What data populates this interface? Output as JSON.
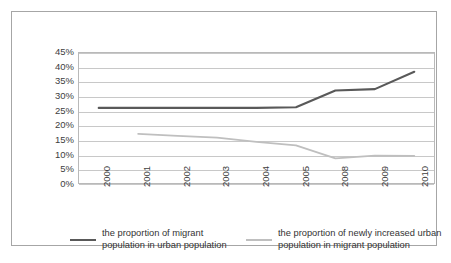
{
  "chart_data": {
    "type": "line",
    "title": "",
    "subtitle": "",
    "xlabel": "",
    "ylabel": "",
    "categories": [
      "2000",
      "2001",
      "2002",
      "2003",
      "2004",
      "2005",
      "2008",
      "2009",
      "2010"
    ],
    "ylim": [
      0,
      45
    ],
    "y_tick_labels": [
      "0%",
      "5%",
      "10%",
      "15%",
      "20%",
      "25%",
      "30%",
      "35%",
      "40%",
      "45%"
    ],
    "y_tick_values": [
      0,
      5,
      10,
      15,
      20,
      25,
      30,
      35,
      40,
      45
    ],
    "grid": "horizontal",
    "legend_position": "bottom",
    "series": [
      {
        "name": "the proportion of migrant population in urban population",
        "color": "#595959",
        "values": [
          26,
          26,
          26,
          26,
          26,
          26.2,
          32,
          32.5,
          38.5
        ]
      },
      {
        "name": "the proportion of newly increased urban population in migrant population",
        "color": "#bfbfbf",
        "values": [
          null,
          17,
          16.3,
          15.7,
          14.2,
          13,
          8.5,
          9.5,
          9.4
        ]
      }
    ]
  },
  "axes": {
    "y_ticks": [
      {
        "label": "45%",
        "value": 45
      },
      {
        "label": "40%",
        "value": 40
      },
      {
        "label": "35%",
        "value": 35
      },
      {
        "label": "30%",
        "value": 30
      },
      {
        "label": "25%",
        "value": 25
      },
      {
        "label": "20%",
        "value": 20
      },
      {
        "label": "15%",
        "value": 15
      },
      {
        "label": "10%",
        "value": 10
      },
      {
        "label": "5%",
        "value": 5
      },
      {
        "label": "0%",
        "value": 0
      }
    ],
    "x_ticks": [
      {
        "label": "2000"
      },
      {
        "label": "2001"
      },
      {
        "label": "2002"
      },
      {
        "label": "2003"
      },
      {
        "label": "2004"
      },
      {
        "label": "2005"
      },
      {
        "label": "2008"
      },
      {
        "label": "2009"
      },
      {
        "label": "2010"
      }
    ]
  },
  "legend": {
    "entries": [
      {
        "name": "the proportion of migrant population in urban population",
        "line1": "the proportion of migrant",
        "line2": "population in urban population",
        "color": "#595959"
      },
      {
        "name": "the proportion of newly increased urban population in migrant population",
        "line1": "the proportion of newly increased urban",
        "line2": "population in migrant population",
        "color": "#bfbfbf"
      }
    ]
  },
  "colors": {
    "series_dark": "#595959",
    "series_light": "#bfbfbf",
    "gridline": "#c8c8c8",
    "plot_border": "#b9b9b9",
    "outer_border": "#a6a6a6",
    "text": "#404040",
    "background": "#ffffff"
  }
}
